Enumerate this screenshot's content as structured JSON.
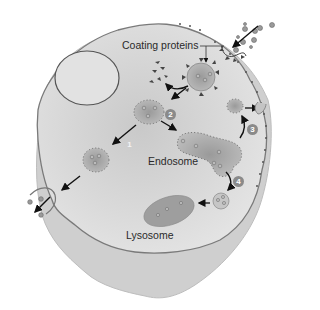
{
  "diagram": {
    "type": "cell-endocytosis-illustration",
    "labels": {
      "coating_proteins": "Coating proteins",
      "endosome": "Endosome",
      "lysosome": "Lysosome"
    },
    "steps": [
      {
        "number": "1"
      },
      {
        "number": "2"
      },
      {
        "number": "3"
      },
      {
        "number": "4"
      }
    ],
    "icons": {
      "nucleus": "nucleus-icon",
      "coated-vesicle": "coated-vesicle-icon",
      "endosome": "endosome-icon",
      "lysosome": "lysosome-icon",
      "receptor-particles": "particle-icon"
    },
    "colors": {
      "cytoplasm": "#d9d9d9",
      "cell_outer": "#cfcfcf",
      "membrane": "#7a7a7a",
      "vesicle": "#a6a6a6",
      "arrow": "#111111"
    }
  }
}
